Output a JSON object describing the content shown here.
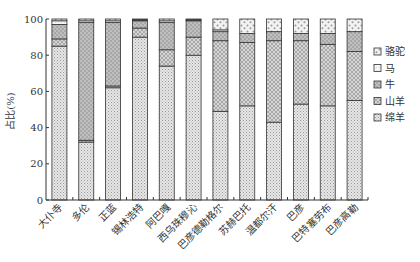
{
  "chart_data": {
    "type": "bar",
    "stacked": true,
    "title": "",
    "xlabel": "",
    "ylabel": "占比(%)",
    "ylim": [
      0,
      100
    ],
    "yticks": [
      0,
      20,
      40,
      60,
      80,
      100
    ],
    "grid": false,
    "legend_position": "right",
    "categories": [
      "大仆寺",
      "多伦",
      "正蓝",
      "锡林浩特",
      "阿巴嘎",
      "西乌珠穆沁",
      "巴彦德勒格尔",
      "苏赫巴托",
      "温都尔汗",
      "巴彦",
      "巴特塞劳布",
      "巴彦高勒"
    ],
    "series": [
      {
        "name": "绵羊",
        "values": [
          85,
          32,
          62,
          90,
          74,
          80,
          49,
          52,
          43,
          53,
          52,
          55
        ]
      },
      {
        "name": "山羊",
        "values": [
          4,
          1,
          1,
          5,
          9,
          10,
          39,
          35,
          45,
          35,
          34,
          27
        ]
      },
      {
        "name": "牛",
        "values": [
          8,
          65,
          35,
          4,
          15,
          9,
          5,
          5,
          5,
          4,
          6,
          11
        ]
      },
      {
        "name": "马",
        "values": [
          2,
          1,
          1,
          0.5,
          1,
          0.5,
          1,
          0,
          0,
          0,
          0,
          0
        ]
      },
      {
        "name": "骆驼",
        "values": [
          1,
          1,
          1,
          0.5,
          1,
          0.5,
          6,
          8,
          7,
          8,
          8,
          7
        ]
      }
    ],
    "legend": [
      "骆驼",
      "马",
      "牛",
      "山羊",
      "绵羊"
    ]
  },
  "colors": {
    "绵羊": "#dcdcdc",
    "山羊": "#cfcfcf",
    "牛": "#a9a9a9",
    "马": "#f4f4f4",
    "骆驼": "#e8e8e8",
    "outline": "#333333"
  }
}
